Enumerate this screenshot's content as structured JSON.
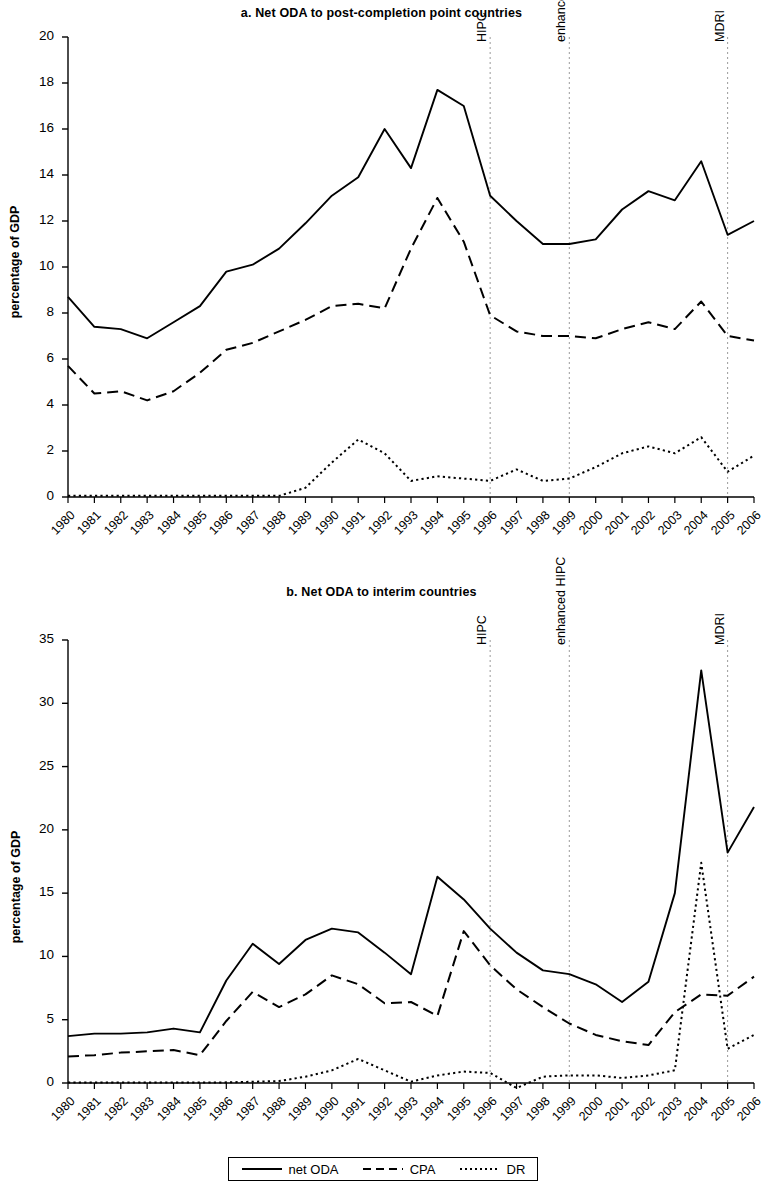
{
  "figure": {
    "ylabel": "percentage of GDP",
    "legend": [
      {
        "label": "net ODA",
        "style": "solid"
      },
      {
        "label": "CPA",
        "style": "dashed"
      },
      {
        "label": "DR",
        "style": "dotted"
      }
    ]
  },
  "chart_data": [
    {
      "type": "line",
      "title": "a. Net ODA to post-completion point countries",
      "xlabel": "",
      "ylabel": "percentage of GDP",
      "grid": false,
      "legend_position": "bottom",
      "ylim": [
        0,
        20
      ],
      "yticks": [
        0,
        2,
        4,
        6,
        8,
        10,
        12,
        14,
        16,
        18,
        20
      ],
      "x": [
        1980,
        1981,
        1982,
        1983,
        1984,
        1985,
        1986,
        1987,
        1988,
        1989,
        1990,
        1991,
        1992,
        1993,
        1994,
        1995,
        1996,
        1997,
        1998,
        1999,
        2000,
        2001,
        2002,
        2003,
        2004,
        2005,
        2006
      ],
      "categories": [
        "1980",
        "1981",
        "1982",
        "1983",
        "1984",
        "1985",
        "1986",
        "1987",
        "1988",
        "1989",
        "1990",
        "1991",
        "1992",
        "1993",
        "1994",
        "1995",
        "1996",
        "1997",
        "1998",
        "1999",
        "2000",
        "2001",
        "2002",
        "2003",
        "2004",
        "2005",
        "2006"
      ],
      "series": [
        {
          "name": "net ODA",
          "style": "solid",
          "values": [
            8.7,
            7.4,
            7.3,
            6.9,
            7.6,
            8.3,
            9.8,
            10.1,
            10.8,
            11.9,
            13.1,
            13.9,
            16.0,
            14.3,
            17.7,
            17.0,
            13.1,
            12.0,
            11.0,
            11.0,
            11.2,
            12.5,
            13.3,
            12.9,
            14.6,
            11.4,
            12.0
          ]
        },
        {
          "name": "CPA",
          "style": "dashed",
          "values": [
            5.7,
            4.5,
            4.6,
            4.2,
            4.6,
            5.4,
            6.4,
            6.7,
            7.2,
            7.7,
            8.3,
            8.4,
            8.2,
            10.8,
            13.0,
            11.1,
            7.9,
            7.2,
            7.0,
            7.0,
            6.9,
            7.3,
            7.6,
            7.3,
            8.5,
            7.0,
            6.8
          ]
        },
        {
          "name": "DR",
          "style": "dotted",
          "values": [
            0.05,
            0.05,
            0.05,
            0.05,
            0.05,
            0.05,
            0.05,
            0.05,
            0.05,
            0.4,
            1.5,
            2.5,
            1.9,
            0.7,
            0.9,
            0.8,
            0.7,
            1.2,
            0.7,
            0.8,
            1.3,
            1.9,
            2.2,
            1.9,
            2.6,
            1.1,
            1.8
          ]
        }
      ],
      "annotations": [
        {
          "label": "HIPC",
          "x": 1996
        },
        {
          "label": "enhanced HIPC",
          "x": 1999
        },
        {
          "label": "MDRI",
          "x": 2005
        }
      ]
    },
    {
      "type": "line",
      "title": "b. Net ODA to interim countries",
      "xlabel": "",
      "ylabel": "percentage of GDP",
      "grid": false,
      "legend_position": "bottom",
      "ylim": [
        0,
        35
      ],
      "yticks": [
        0,
        5,
        10,
        15,
        20,
        25,
        30,
        35
      ],
      "x": [
        1980,
        1981,
        1982,
        1983,
        1984,
        1985,
        1986,
        1987,
        1988,
        1989,
        1990,
        1991,
        1992,
        1993,
        1994,
        1995,
        1996,
        1997,
        1998,
        1999,
        2000,
        2001,
        2002,
        2003,
        2004,
        2005,
        2006
      ],
      "categories": [
        "1980",
        "1981",
        "1982",
        "1983",
        "1984",
        "1985",
        "1986",
        "1987",
        "1988",
        "1989",
        "1990",
        "1991",
        "1992",
        "1993",
        "1994",
        "1995",
        "1996",
        "1997",
        "1998",
        "1999",
        "2000",
        "2001",
        "2002",
        "2003",
        "2004",
        "2005",
        "2006"
      ],
      "series": [
        {
          "name": "net ODA",
          "style": "solid",
          "values": [
            3.7,
            3.9,
            3.9,
            4.0,
            4.3,
            4.0,
            8.1,
            11.0,
            9.4,
            11.3,
            12.2,
            11.9,
            10.3,
            8.6,
            16.3,
            14.5,
            12.2,
            10.3,
            8.9,
            8.6,
            7.8,
            6.4,
            8.0,
            15.0,
            32.6,
            18.2,
            21.8,
            16.6
          ]
        },
        {
          "name": "CPA",
          "style": "dashed",
          "values": [
            2.1,
            2.2,
            2.4,
            2.5,
            2.6,
            2.2,
            4.9,
            7.2,
            6.0,
            7.0,
            8.5,
            7.8,
            6.3,
            6.4,
            5.3,
            12.0,
            9.3,
            7.4,
            6.0,
            4.7,
            3.8,
            3.3,
            3.0,
            5.6,
            7.0,
            6.9,
            8.4,
            9.6,
            9.4,
            7.7
          ]
        },
        {
          "name": "DR",
          "style": "dotted",
          "values": [
            0.03,
            0.03,
            0.03,
            0.03,
            0.03,
            0.03,
            0.05,
            0.1,
            0.15,
            0.5,
            1.0,
            1.9,
            1.0,
            0.1,
            0.6,
            0.9,
            0.8,
            -0.4,
            0.5,
            0.6,
            0.6,
            0.4,
            0.6,
            1.0,
            17.4,
            2.7,
            3.8,
            2.9
          ]
        }
      ],
      "annotations": [
        {
          "label": "HIPC",
          "x": 1996
        },
        {
          "label": "enhanced HIPC",
          "x": 1999
        },
        {
          "label": "MDRI",
          "x": 2005
        }
      ]
    }
  ]
}
